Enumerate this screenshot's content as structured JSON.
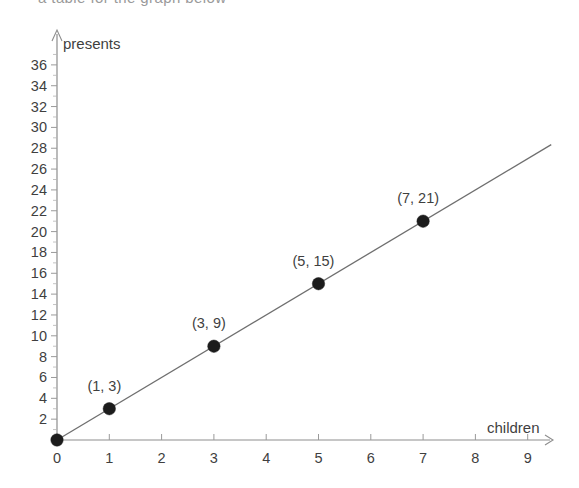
{
  "page": {
    "cropped_heading_fragment": "a table for the graph below",
    "background_color": "#ffffff",
    "ink_color": "#3f3f3f",
    "point_color": "#1c1c1c",
    "line_color": "#6f6f6f",
    "axis_color": "#8d8d8d"
  },
  "chart_data": {
    "type": "scatter",
    "title": "",
    "subtitle": "",
    "xlabel": "children",
    "ylabel": "presents",
    "xlim": [
      0,
      9.5
    ],
    "ylim": [
      0,
      37.5
    ],
    "xticks": [
      0,
      1,
      2,
      3,
      4,
      5,
      6,
      7,
      8,
      9
    ],
    "yticks": [
      2,
      4,
      6,
      8,
      10,
      12,
      14,
      16,
      18,
      20,
      22,
      24,
      26,
      28,
      30,
      32,
      34,
      36
    ],
    "y_minor_tick_step": 1,
    "grid": false,
    "legend": false,
    "x": [
      0,
      1,
      3,
      5,
      7
    ],
    "y": [
      0,
      3,
      9,
      15,
      21
    ],
    "points": [
      {
        "x": 0,
        "y": 0,
        "label": "",
        "label_dx": 0,
        "label_dy": 0
      },
      {
        "x": 1,
        "y": 3,
        "label": "(1, 3)",
        "label_dx": -5,
        "label_dy": -18
      },
      {
        "x": 3,
        "y": 9,
        "label": "(3, 9)",
        "label_dx": -5,
        "label_dy": -18
      },
      {
        "x": 5,
        "y": 15,
        "label": "(5, 15)",
        "label_dx": -5,
        "label_dy": -18
      },
      {
        "x": 7,
        "y": 21,
        "label": "(7, 21)",
        "label_dx": -5,
        "label_dy": -18
      }
    ],
    "trend_line": {
      "slope": 3,
      "intercept": 0,
      "x_start": 0,
      "x_end": 9.45,
      "equation": "y = 3x"
    },
    "annotations": []
  }
}
